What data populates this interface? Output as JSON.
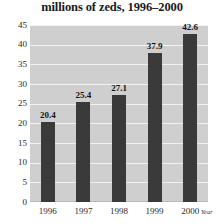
{
  "chart_data": {
    "type": "bar",
    "title": "millions of zeds, 1996–2000",
    "xlabel": "Year",
    "ylabel": "",
    "categories": [
      "1996",
      "1997",
      "1998",
      "1999",
      "2000"
    ],
    "values": [
      20.4,
      25.4,
      27.1,
      37.9,
      42.6
    ],
    "data_labels": [
      "20.4",
      "25.4",
      "27.1",
      "37.9",
      "42.6"
    ],
    "ylim": [
      0,
      45
    ],
    "ytick_labels": [
      "45",
      "40",
      "35",
      "30",
      "25",
      "20",
      "15",
      "10",
      "5",
      "0"
    ],
    "ytick_values": [
      45,
      40,
      35,
      30,
      25,
      20,
      15,
      10,
      5,
      0
    ],
    "grid": true,
    "legend": false,
    "colors": {
      "bar": "#3a3a3a",
      "plot_background": "#cfcfcf",
      "gridline": "#f2f2f2",
      "page_background": "#ffffff",
      "text": "#1a1a1a"
    }
  }
}
